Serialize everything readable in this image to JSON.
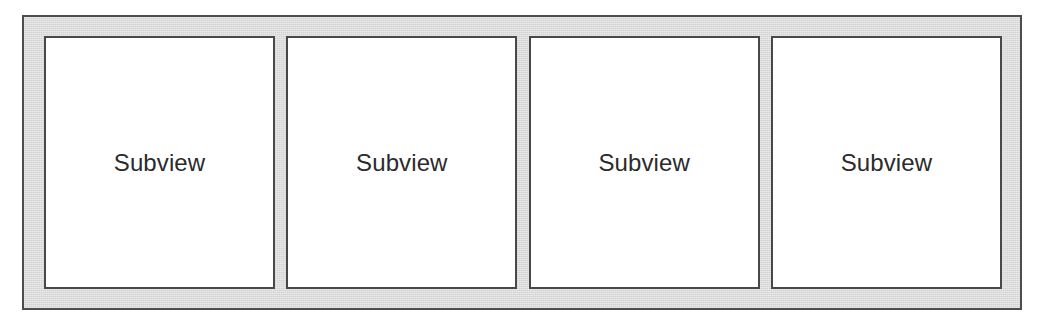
{
  "diagram": {
    "type": "nested-box-layout",
    "canvas": {
      "width": 1042,
      "height": 324,
      "background_color": "#ffffff"
    },
    "parent_view": {
      "name": "parent-container",
      "fill_color": "#dcdcdc",
      "border_color": "#4d4d4d",
      "border_width_px": 2,
      "x": 22,
      "y": 15,
      "width": 1000,
      "height": 295
    },
    "subviews": [
      {
        "label": "Subview",
        "fill_color": "#ffffff",
        "border_color": "#484848",
        "border_width_px": 2,
        "x": 44,
        "y": 36,
        "width": 231,
        "height": 253
      },
      {
        "label": "Subview",
        "fill_color": "#ffffff",
        "border_color": "#484848",
        "border_width_px": 2,
        "x": 285,
        "y": 36,
        "width": 231,
        "height": 253
      },
      {
        "label": "Subview",
        "fill_color": "#ffffff",
        "border_color": "#484848",
        "border_width_px": 2,
        "x": 527,
        "y": 36,
        "width": 231,
        "height": 253
      },
      {
        "label": "Subview",
        "fill_color": "#ffffff",
        "border_color": "#484848",
        "border_width_px": 2,
        "x": 770,
        "y": 36,
        "width": 231,
        "height": 253
      }
    ],
    "text_color": "#2b2b2b",
    "label_font_size_px": 24
  }
}
